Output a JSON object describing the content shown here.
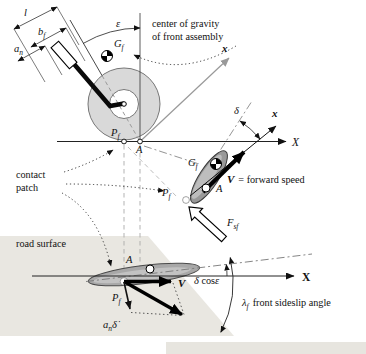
{
  "figure": {
    "side": {
      "dim_l": "l",
      "dim_b_base": "b",
      "dim_b_sub": "f",
      "dim_a_base": "a",
      "dim_a_sub": "n",
      "rake": "ε",
      "cog_base": "G",
      "cog_sub": "f",
      "steer_x": "x",
      "ground_X": "X",
      "contact_base": "P",
      "contact_sub": "f",
      "axis_point": "A"
    },
    "notes": {
      "cog_line1": "center of gravity",
      "cog_line2": "of front assembly",
      "contact_line1": "contact",
      "contact_line2": "patch",
      "road": "road surface"
    },
    "top": {
      "cog_base": "G",
      "cog_sub": "f",
      "point_a": "A",
      "contact_base": "P",
      "contact_sub": "f",
      "steer_angle": "δ",
      "x_axis": "x",
      "speed_v": "V",
      "speed_eq": "= forward speed",
      "force_base": "F",
      "force_sub": "sf"
    },
    "bottom": {
      "point_a": "A",
      "contact_base": "P",
      "contact_sub": "f",
      "velocity": "V",
      "eff_steer_delta": "δ",
      "eff_steer_cos": "cos",
      "eff_steer_eps": "ε",
      "axis_X": "X",
      "an_base": "a",
      "an_sub": "n",
      "an_delta": "δ̇",
      "slip_base": "λ",
      "slip_sub": "f",
      "slip_text": "front sideslip angle"
    },
    "colors": {
      "road_surface": "#e9e7e1",
      "wheel_tire": "#d9d9d9",
      "patch_gray": "#a8a8a8",
      "construction_gray": "#9a9a9a",
      "ink": "#1a1a1a"
    }
  }
}
